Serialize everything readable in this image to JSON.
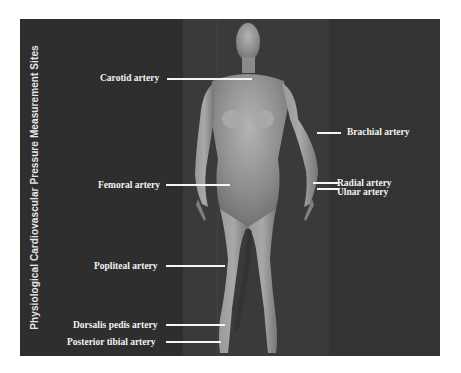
{
  "figure": {
    "title": "Physiological Cardiovascular Pressure Measurement Sites",
    "colors": {
      "background": "#2e2e2e",
      "center_band": "#3a3a3a",
      "figure_body": "#8a8a8a",
      "label_text": "#f2f2f2",
      "leader_line": "#f5f5f5"
    },
    "labels": {
      "carotid": "Carotid artery",
      "brachial": "Brachial artery",
      "femoral": "Femoral artery",
      "radial": "Radial artery",
      "ulnar": "Ulnar artery",
      "popliteal": "Popliteal artery",
      "dorsalis_pedis": "Dorsalis pedis artery",
      "posterior_tibial": "Posterior tibial artery"
    }
  }
}
